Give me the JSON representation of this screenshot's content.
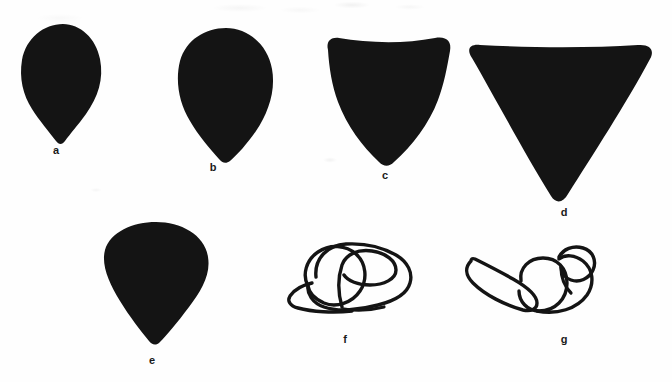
{
  "figure": {
    "caption_present": false,
    "background_color": "#fefefe",
    "ink_color": "#141414",
    "label_color": "#1a1a1a"
  },
  "panels": [
    {
      "id": "a",
      "label": "a",
      "style": "filled-silhouette",
      "shape_name": "teardrop-ovoid",
      "label_x": 56,
      "label_y": 150,
      "bbox": {
        "x": 20,
        "y": 23,
        "width": 82,
        "height": 119
      }
    },
    {
      "id": "b",
      "label": "b",
      "style": "filled-silhouette",
      "shape_name": "broad-teardrop",
      "label_x": 213,
      "label_y": 167,
      "bbox": {
        "x": 176,
        "y": 27,
        "width": 98,
        "height": 134
      }
    },
    {
      "id": "c",
      "label": "c",
      "style": "filled-silhouette",
      "shape_name": "rounded-triangle",
      "label_x": 385,
      "label_y": 175,
      "bbox": {
        "x": 318,
        "y": 36,
        "width": 134,
        "height": 130
      }
    },
    {
      "id": "d",
      "label": "d",
      "style": "filled-silhouette",
      "shape_name": "inverted-triangle",
      "label_x": 564,
      "label_y": 212,
      "bbox": {
        "x": 462,
        "y": 45,
        "width": 192,
        "height": 158
      }
    },
    {
      "id": "e",
      "label": "e",
      "style": "filled-silhouette",
      "shape_name": "conical-teardrop",
      "label_x": 152,
      "label_y": 360,
      "bbox": {
        "x": 103,
        "y": 221,
        "width": 105,
        "height": 121
      }
    },
    {
      "id": "f",
      "label": "f",
      "style": "line-outline",
      "shape_name": "coiled-lobe-outline",
      "label_x": 345,
      "label_y": 340,
      "bbox": {
        "x": 288,
        "y": 243,
        "width": 122,
        "height": 72
      }
    },
    {
      "id": "g",
      "label": "g",
      "style": "line-outline",
      "shape_name": "crescent-and-coil-outline",
      "label_x": 564,
      "label_y": 340,
      "bbox": {
        "x": 463,
        "y": 246,
        "width": 132,
        "height": 72
      }
    }
  ]
}
